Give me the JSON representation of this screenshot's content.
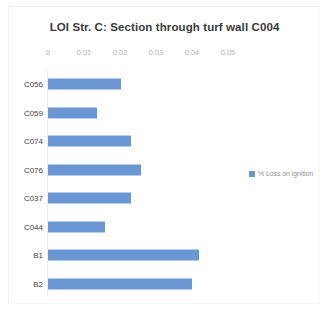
{
  "chart_data": {
    "type": "bar",
    "orientation": "horizontal",
    "title": "LOI Str. C: Section through turf wall C004",
    "xlabel": "",
    "ylabel": "",
    "categories": [
      "C056",
      "C059",
      "C074",
      "C076",
      "C037",
      "C044",
      "B1",
      "B2"
    ],
    "values": [
      0.0202,
      0.0136,
      0.0231,
      0.0259,
      0.0231,
      0.0158,
      0.0419,
      0.0401
    ],
    "series": [
      {
        "name": "% Loss on ignition",
        "values": [
          0.0202,
          0.0136,
          0.0231,
          0.0259,
          0.0231,
          0.0158,
          0.0419,
          0.0401
        ]
      }
    ],
    "xlim": [
      0,
      0.05
    ],
    "xticks": [
      0,
      0.01,
      0.02,
      0.03,
      0.04,
      0.05
    ],
    "xtick_labels": [
      "0",
      "0.01",
      "0.02",
      "0.03",
      "0.04",
      "0.05"
    ],
    "xaxis_position": "top",
    "grid": false,
    "legend": {
      "entries": [
        "% Loss on ignition"
      ],
      "position": "right"
    },
    "bar_color": "#6a97d4"
  }
}
